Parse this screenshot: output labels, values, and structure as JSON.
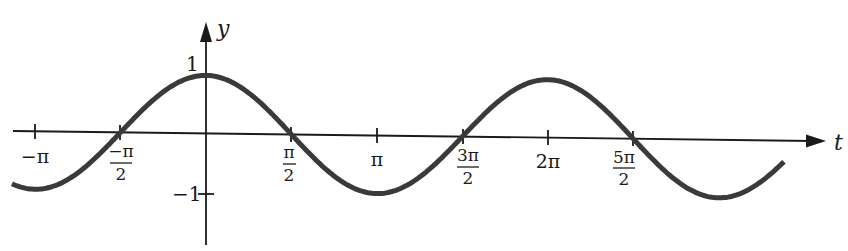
{
  "chart_data": {
    "type": "line",
    "title": "",
    "function": "y = cos(t)",
    "xlabel": "t",
    "ylabel": "y",
    "xlim": [
      -3.49,
      8.67
    ],
    "ylim": [
      -1.2,
      1.2
    ],
    "grid": false,
    "legend": null,
    "x_ticks": [
      {
        "value": -3.14159,
        "num": "−π",
        "den": ""
      },
      {
        "value": -1.5708,
        "num": "−π",
        "den": "2"
      },
      {
        "value": 1.5708,
        "num": "π",
        "den": "2"
      },
      {
        "value": 3.14159,
        "num": "π",
        "den": ""
      },
      {
        "value": 4.7124,
        "num": "3π",
        "den": "2"
      },
      {
        "value": 6.28319,
        "num": "2π",
        "den": ""
      },
      {
        "value": 7.854,
        "num": "5π",
        "den": "2"
      }
    ],
    "y_ticks": [
      {
        "value": 1,
        "label": "1"
      },
      {
        "value": -1,
        "label": "−1"
      }
    ],
    "series": [
      {
        "name": "cos t",
        "x": [
          -3.5,
          -3.14159,
          -2.356,
          -1.5708,
          -0.785,
          0,
          0.785,
          1.5708,
          2.356,
          3.14159,
          3.927,
          4.7124,
          5.498,
          6.28319,
          7.069,
          7.854,
          8.639,
          9.2
        ],
        "y": [
          -0.94,
          -1,
          -0.707,
          0,
          0.707,
          1,
          0.707,
          0,
          -0.707,
          -1,
          -0.707,
          0,
          0.707,
          1,
          0.707,
          0,
          -0.707,
          -0.97
        ]
      }
    ],
    "colors": {
      "curve": "#3a3a3a",
      "axes": "#1a1a1a"
    }
  }
}
